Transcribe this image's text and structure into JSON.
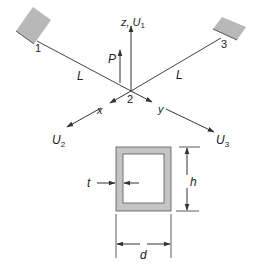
{
  "diagram": {
    "colors": {
      "line": "#333333",
      "support_fill": "#b8b8b8",
      "section_fill": "#c4c4c4",
      "background": "#ffffff"
    },
    "nodes": [
      {
        "id": "1",
        "label": "1"
      },
      {
        "id": "2",
        "label": "2"
      },
      {
        "id": "3",
        "label": "3"
      }
    ],
    "members": [
      {
        "from": "1",
        "to": "2",
        "label": "L"
      },
      {
        "from": "3",
        "to": "2",
        "label": "L"
      }
    ],
    "load": {
      "label": "P"
    },
    "axes": {
      "z_label": "z, U",
      "z_sub": "1",
      "x_label": "x",
      "y_label": "y",
      "u2_label": "U",
      "u2_sub": "2",
      "u3_label": "U",
      "u3_sub": "3"
    },
    "section": {
      "thickness_label": "t",
      "height_label": "h",
      "width_label": "d"
    }
  }
}
